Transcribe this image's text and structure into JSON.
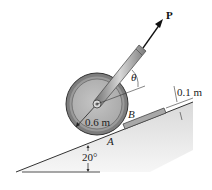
{
  "diagram": {
    "type": "engineering-statics-figure",
    "labels": {
      "force": "P",
      "angle_theta": "θ",
      "block_thickness": "0.1 m",
      "point_b": "B",
      "point_a": "A",
      "radius": "0.6 m",
      "incline_angle": "20°"
    },
    "elements": [
      {
        "name": "inclined-plane",
        "angle_deg": 20
      },
      {
        "name": "wheel",
        "radius_label": "0.6 m"
      },
      {
        "name": "handle-rod",
        "force_label": "P",
        "angle_label": "θ"
      },
      {
        "name": "step-block",
        "thickness_label": "0.1 m",
        "contact_point": "B"
      },
      {
        "name": "ground-contact",
        "contact_point": "A"
      }
    ],
    "colors": {
      "wheel_rim": "#8a8a8a",
      "wheel_face": "#b9b9b9",
      "incline_fill": "#d9d9d9",
      "block_fill": "#a8a8a8",
      "line": "#222222"
    }
  }
}
